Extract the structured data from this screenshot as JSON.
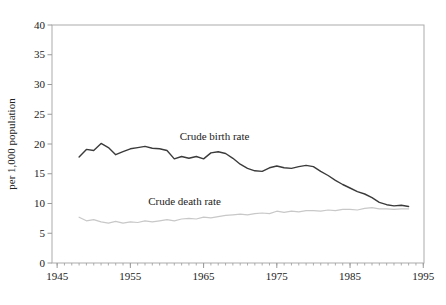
{
  "chart_data": {
    "type": "line",
    "title": "",
    "xlabel": "",
    "ylabel": "per 1,000 population",
    "xlim": [
      1944.3,
      1995.1
    ],
    "ylim": [
      0,
      40
    ],
    "xticks": [
      1945,
      1955,
      1965,
      1975,
      1985,
      1995
    ],
    "yticks": [
      0,
      5,
      10,
      15,
      20,
      25,
      30,
      35,
      40
    ],
    "minor_xtick_every_years": 1,
    "grid": false,
    "frame": true,
    "legend": "inline-annotations",
    "axis_color": "#9a9a9a",
    "frame_color": "#ababab",
    "text_color": "#222222",
    "x": [
      1948,
      1949,
      1950,
      1951,
      1952,
      1953,
      1954,
      1955,
      1956,
      1957,
      1958,
      1959,
      1960,
      1961,
      1962,
      1963,
      1964,
      1965,
      1966,
      1967,
      1968,
      1969,
      1970,
      1971,
      1972,
      1973,
      1974,
      1975,
      1976,
      1977,
      1978,
      1979,
      1980,
      1981,
      1982,
      1983,
      1984,
      1985,
      1986,
      1987,
      1988,
      1989,
      1990,
      1991,
      1992,
      1993
    ],
    "series": [
      {
        "name": "Crude birth rate",
        "color": "#3b3b3b",
        "stroke_width": 1.4,
        "values": [
          17.8,
          19.1,
          18.9,
          20.1,
          19.4,
          18.2,
          18.7,
          19.2,
          19.4,
          19.6,
          19.3,
          19.2,
          18.9,
          17.5,
          17.9,
          17.6,
          17.9,
          17.5,
          18.5,
          18.7,
          18.4,
          17.6,
          16.6,
          15.9,
          15.5,
          15.4,
          16.0,
          16.3,
          16.0,
          15.9,
          16.2,
          16.4,
          16.2,
          15.4,
          14.7,
          13.9,
          13.2,
          12.6,
          12.0,
          11.6,
          11.0,
          10.2,
          9.8,
          9.6,
          9.7,
          9.5
        ]
      },
      {
        "name": "Crude death rate",
        "color": "#c8c8c8",
        "stroke_width": 1.2,
        "values": [
          7.7,
          7.1,
          7.3,
          6.9,
          6.7,
          7.0,
          6.7,
          6.9,
          6.8,
          7.1,
          6.9,
          7.1,
          7.3,
          7.1,
          7.4,
          7.5,
          7.4,
          7.7,
          7.6,
          7.8,
          8.0,
          8.1,
          8.2,
          8.1,
          8.3,
          8.4,
          8.3,
          8.7,
          8.5,
          8.7,
          8.6,
          8.8,
          8.8,
          8.7,
          8.9,
          8.8,
          9.0,
          9.0,
          8.9,
          9.2,
          9.3,
          9.1,
          9.1,
          9.0,
          9.1,
          9.1
        ]
      }
    ],
    "annotations": [
      {
        "text": "Crude birth rate",
        "x": 1966.5,
        "y": 21.3
      },
      {
        "text": "Crude death rate",
        "x": 1962.4,
        "y": 10.5
      }
    ]
  }
}
